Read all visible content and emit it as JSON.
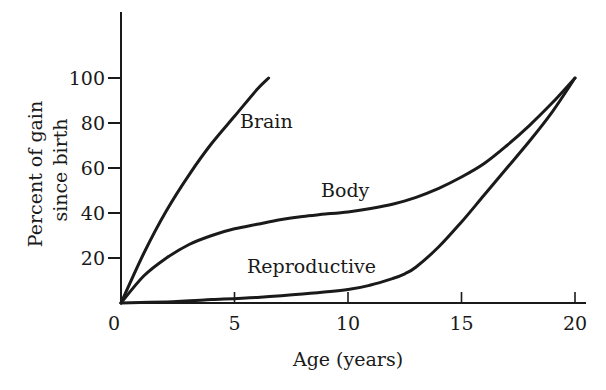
{
  "chart_data": {
    "type": "line",
    "title": "",
    "xlabel": "Age (years)",
    "ylabel": [
      "Percent of gain",
      "since birth"
    ],
    "xlim": [
      0,
      20
    ],
    "ylim": [
      0,
      100
    ],
    "xticks": [
      0,
      5,
      10,
      15,
      20
    ],
    "yticks": [
      20,
      40,
      60,
      80,
      100
    ],
    "grid": false,
    "legend": "inline labels",
    "series": [
      {
        "name": "Brain",
        "x": [
          0,
          1,
          2,
          3,
          4,
          5,
          6,
          6.5
        ],
        "values": [
          0,
          22,
          41,
          57,
          71,
          83,
          95,
          100
        ]
      },
      {
        "name": "Body",
        "x": [
          0,
          1,
          2,
          3,
          4,
          5,
          6,
          7,
          8,
          9,
          10,
          11,
          12,
          13,
          14,
          15,
          16,
          17,
          18,
          19,
          20
        ],
        "values": [
          0,
          12,
          20,
          26,
          30,
          33,
          35,
          37,
          38.5,
          39.5,
          40.5,
          42,
          44,
          47,
          51,
          56,
          62,
          70,
          79,
          89,
          100
        ]
      },
      {
        "name": "Reproductive",
        "x": [
          0,
          2,
          4,
          6,
          8,
          10,
          11,
          12,
          12.5,
          13,
          14,
          15,
          16,
          17,
          18,
          19,
          20
        ],
        "values": [
          0,
          0.5,
          1.5,
          2.5,
          4,
          6,
          8,
          11,
          13,
          16,
          25,
          36,
          48,
          60,
          72,
          85,
          100
        ]
      }
    ],
    "label_positions": {
      "Brain": {
        "x": 240,
        "y": 128
      },
      "Body": {
        "x": 321,
        "y": 197
      },
      "Reproductive": {
        "x": 247,
        "y": 273
      }
    }
  },
  "axes": {
    "x_title": "Age (years)",
    "y_title_line1": "Percent of gain",
    "y_title_line2": "since birth",
    "x_tick_labels": [
      "0",
      "5",
      "10",
      "15",
      "20"
    ],
    "y_tick_labels": [
      "20",
      "40",
      "60",
      "80",
      "100"
    ]
  },
  "labels": {
    "brain": "Brain",
    "body": "Body",
    "reproductive": "Reproductive"
  }
}
